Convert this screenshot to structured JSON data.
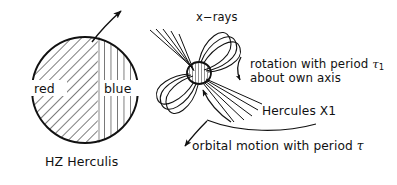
{
  "figure": {
    "background_color": "#ffffff",
    "ink_color": "#111111"
  },
  "labels": {
    "xrays": "x−rays",
    "red": "red",
    "blue": "blue",
    "companion_star": "HZ Herculis",
    "rotation_line1": "rotation with period ",
    "rotation_tau": "τ",
    "rotation_tau_sub": "1",
    "rotation_line2": "about own axis",
    "neutron_star": "Hercules X1",
    "orbital_line": "orbital motion with period ",
    "orbital_tau": "τ"
  },
  "geometry": {
    "companion_star": {
      "cx": 85,
      "cy": 90,
      "r": 53,
      "hatch_left": "diagonal",
      "hatch_right": "vertical"
    },
    "neutron_star": {
      "cx": 199,
      "cy": 73,
      "rx": 12,
      "ry": 11,
      "hatch": "vertical"
    },
    "rotation_axis_arrow": {
      "from": [
        92,
        42
      ],
      "to": [
        123,
        10
      ]
    },
    "spin_arrow": {
      "x": 240,
      "y_from": 58,
      "y_to": 81
    },
    "orbit_arrow": {
      "from": [
        205,
        121
      ],
      "to": [
        185,
        147
      ]
    },
    "xray_beam_count_upper": 5,
    "xray_beam_count_lower": 5,
    "field_loop_count": 3
  }
}
